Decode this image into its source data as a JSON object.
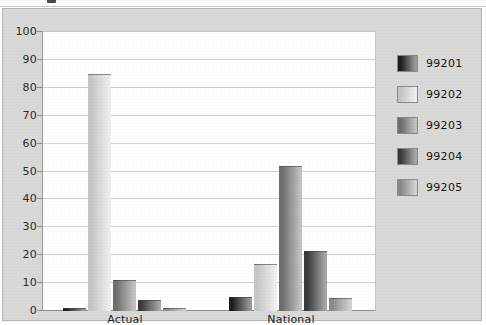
{
  "chart_data": {
    "type": "bar",
    "title": "",
    "subtitle": "",
    "xlabel": "",
    "ylabel": "",
    "categories": [
      "Actual",
      "National"
    ],
    "series": [
      {
        "name": "99201",
        "values": [
          1,
          5
        ]
      },
      {
        "name": "99202",
        "values": [
          85,
          17
        ]
      },
      {
        "name": "99203",
        "values": [
          11,
          52
        ]
      },
      {
        "name": "99204",
        "values": [
          4,
          21.5
        ]
      },
      {
        "name": "99205",
        "values": [
          1,
          4.5
        ]
      }
    ],
    "ylim": [
      0,
      100
    ],
    "yticks": [
      0,
      10,
      20,
      30,
      40,
      50,
      60,
      70,
      80,
      90,
      100
    ],
    "ytick_labels": [
      "0",
      "10",
      "20",
      "30",
      "40",
      "50",
      "60",
      "70",
      "80",
      "90",
      "100"
    ],
    "grid": true,
    "legend_position": "right",
    "legend_entries": [
      "99201",
      "99202",
      "99203",
      "99204",
      "99205"
    ],
    "bar_grouping": "grouped"
  },
  "style": {
    "panel_background": "#d9d9d7",
    "plot_background": "#ffffff",
    "gridline_color": "#d3d3d1",
    "axis_color": "#8d8d8b",
    "text_color": "#1f1f1f",
    "series_colors": [
      {
        "name": "99201",
        "dark": "#1e1e1e",
        "light": "#9a9a98"
      },
      {
        "name": "99202",
        "dark": "#c6c6c4",
        "light": "#efefed"
      },
      {
        "name": "99203",
        "dark": "#6e6e6c",
        "light": "#c2c2c0"
      },
      {
        "name": "99204",
        "dark": "#3a3a3a",
        "light": "#a6a6a4"
      },
      {
        "name": "99205",
        "dark": "#8a8a88",
        "light": "#d2d2d0"
      }
    ]
  },
  "legend": {
    "rows": [
      {
        "label": "99201",
        "swatch": "swatch-99201"
      },
      {
        "label": "99202",
        "swatch": "swatch-99202"
      },
      {
        "label": "99203",
        "swatch": "swatch-99203"
      },
      {
        "label": "99204",
        "swatch": "swatch-99204"
      },
      {
        "label": "99205",
        "swatch": "swatch-99205"
      }
    ]
  }
}
